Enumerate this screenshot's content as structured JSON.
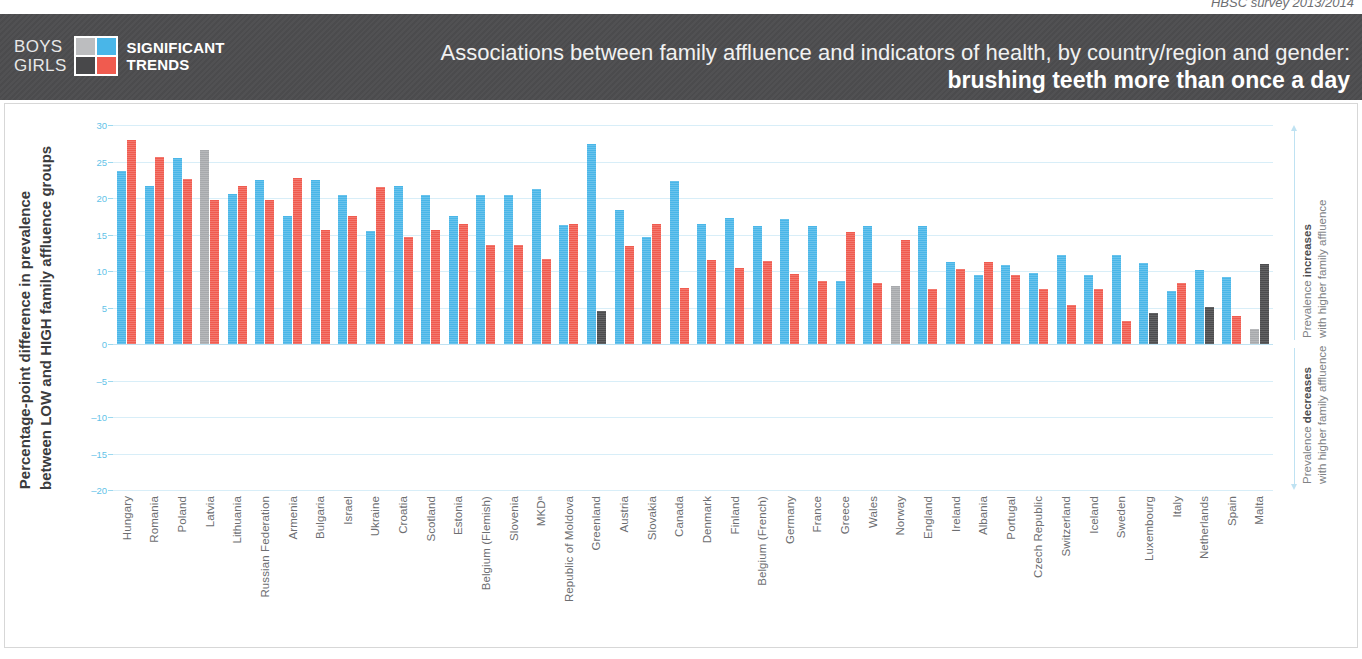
{
  "survey_note": "HBSC survey 2013/2014",
  "legend": {
    "boys_label": "BOYS",
    "girls_label": "GIRLS",
    "significant_line1": "SIGNIFICANT",
    "significant_line2": "TRENDS",
    "colors": {
      "boys_significant": "#49b6e8",
      "girls_significant": "#f05b4f",
      "boys_not_significant": "#a7a9ac",
      "girls_not_significant": "#4d4d4f"
    }
  },
  "header": {
    "title": "Associations between family affluence and indicators of health, by country/region and gender:",
    "subtitle": "brushing teeth more than once a day"
  },
  "axis": {
    "y_caption_line1": "Percentage-point difference in prevalence",
    "y_caption_line2": "between LOW and HIGH family affluence groups",
    "right_top_line1": "Prevalence increases",
    "right_top_bold": "increases",
    "right_top_line2": "with higher family affluence",
    "right_bottom_line1": "Prevalence decreases",
    "right_bottom_bold": "decreases",
    "right_bottom_line2": "with higher family affluence"
  },
  "chart_data": {
    "type": "bar",
    "title": "Associations between family affluence and indicators of health, by country/region and gender: brushing teeth more than once a day",
    "xlabel": "",
    "ylabel": "Percentage-point difference in prevalence between LOW and HIGH family affluence groups",
    "ylim": [
      -20,
      30
    ],
    "yticks": [
      30,
      25,
      20,
      15,
      10,
      5,
      0,
      -5,
      -10,
      -15,
      -20
    ],
    "ytick_labels": [
      "30",
      "25",
      "20",
      "15",
      "10",
      "5",
      "0",
      "–5",
      "–10",
      "–15",
      "–20"
    ],
    "grid": true,
    "legend_position": "top-left",
    "series": [
      {
        "name": "Boys",
        "key": "boys"
      },
      {
        "name": "Girls",
        "key": "girls"
      }
    ],
    "categories": [
      "Hungary",
      "Romania",
      "Poland",
      "Latvia",
      "Lithuania",
      "Russian Federation",
      "Armenia",
      "Bulgaria",
      "Israel",
      "Ukraine",
      "Croatia",
      "Scotland",
      "Estonia",
      "Belgium (Flemish)",
      "Slovenia",
      "MKDᵃ",
      "Republic of Moldova",
      "Greenland",
      "Austria",
      "Slovakia",
      "Canada",
      "Denmark",
      "Finland",
      "Belgium (French)",
      "Germany",
      "France",
      "Greece",
      "Wales",
      "Norway",
      "England",
      "Ireland",
      "Albania",
      "Portugal",
      "Czech Republic",
      "Switzerland",
      "Iceland",
      "Sweden",
      "Luxembourg",
      "Italy",
      "Netherlands",
      "Spain",
      "Malta"
    ],
    "points": [
      {
        "country": "Hungary",
        "boys": 23.7,
        "girls": 27.9,
        "boys_sig": true,
        "girls_sig": true
      },
      {
        "country": "Romania",
        "boys": 21.6,
        "girls": 25.6,
        "boys_sig": true,
        "girls_sig": true
      },
      {
        "country": "Poland",
        "boys": 25.5,
        "girls": 22.6,
        "boys_sig": true,
        "girls_sig": true
      },
      {
        "country": "Latvia",
        "boys": 26.6,
        "girls": 19.7,
        "boys_sig": false,
        "girls_sig": true
      },
      {
        "country": "Lithuania",
        "boys": 20.5,
        "girls": 21.6,
        "boys_sig": true,
        "girls_sig": true
      },
      {
        "country": "Russian Federation",
        "boys": 22.5,
        "girls": 19.7,
        "boys_sig": true,
        "girls_sig": true
      },
      {
        "country": "Armenia",
        "boys": 17.6,
        "girls": 22.7,
        "boys_sig": true,
        "girls_sig": true
      },
      {
        "country": "Bulgaria",
        "boys": 22.5,
        "girls": 15.6,
        "boys_sig": true,
        "girls_sig": true
      },
      {
        "country": "Israel",
        "boys": 20.4,
        "girls": 17.5,
        "boys_sig": true,
        "girls_sig": true
      },
      {
        "country": "Ukraine",
        "boys": 15.5,
        "girls": 21.5,
        "boys_sig": true,
        "girls_sig": true
      },
      {
        "country": "Croatia",
        "boys": 21.6,
        "girls": 14.7,
        "boys_sig": true,
        "girls_sig": true
      },
      {
        "country": "Scotland",
        "boys": 20.4,
        "girls": 15.6,
        "boys_sig": true,
        "girls_sig": true
      },
      {
        "country": "Estonia",
        "boys": 17.5,
        "girls": 16.5,
        "boys_sig": true,
        "girls_sig": true
      },
      {
        "country": "Belgium (Flemish)",
        "boys": 20.4,
        "girls": 13.6,
        "boys_sig": true,
        "girls_sig": true
      },
      {
        "country": "Slovenia",
        "boys": 20.4,
        "girls": 13.6,
        "boys_sig": true,
        "girls_sig": true
      },
      {
        "country": "MKDᵃ",
        "boys": 21.3,
        "girls": 11.6,
        "boys_sig": true,
        "girls_sig": true
      },
      {
        "country": "Republic of Moldova",
        "boys": 16.3,
        "girls": 16.4,
        "boys_sig": true,
        "girls_sig": true
      },
      {
        "country": "Greenland",
        "boys": 27.4,
        "girls": 4.5,
        "boys_sig": true,
        "girls_sig": false
      },
      {
        "country": "Austria",
        "boys": 18.4,
        "girls": 13.4,
        "boys_sig": true,
        "girls_sig": true
      },
      {
        "country": "Slovakia",
        "boys": 14.6,
        "girls": 16.4,
        "boys_sig": true,
        "girls_sig": true
      },
      {
        "country": "Canada",
        "boys": 22.3,
        "girls": 7.7,
        "boys_sig": true,
        "girls_sig": true
      },
      {
        "country": "Denmark",
        "boys": 16.4,
        "girls": 11.5,
        "boys_sig": true,
        "girls_sig": true
      },
      {
        "country": "Finland",
        "boys": 17.2,
        "girls": 10.4,
        "boys_sig": true,
        "girls_sig": true
      },
      {
        "country": "Belgium (French)",
        "boys": 16.2,
        "girls": 11.4,
        "boys_sig": true,
        "girls_sig": true
      },
      {
        "country": "Germany",
        "boys": 17.1,
        "girls": 9.6,
        "boys_sig": true,
        "girls_sig": true
      },
      {
        "country": "France",
        "boys": 16.2,
        "girls": 8.6,
        "boys_sig": true,
        "girls_sig": true
      },
      {
        "country": "Greece",
        "boys": 8.6,
        "girls": 15.3,
        "boys_sig": true,
        "girls_sig": true
      },
      {
        "country": "Wales",
        "boys": 16.1,
        "girls": 8.3,
        "boys_sig": true,
        "girls_sig": true
      },
      {
        "country": "Norway",
        "boys": 8.0,
        "girls": 14.3,
        "boys_sig": false,
        "girls_sig": true
      },
      {
        "country": "England",
        "boys": 16.2,
        "girls": 7.6,
        "boys_sig": true,
        "girls_sig": true
      },
      {
        "country": "Ireland",
        "boys": 11.2,
        "girls": 10.3,
        "boys_sig": true,
        "girls_sig": true
      },
      {
        "country": "Albania",
        "boys": 9.4,
        "girls": 11.2,
        "boys_sig": true,
        "girls_sig": true
      },
      {
        "country": "Portugal",
        "boys": 10.8,
        "girls": 9.4,
        "boys_sig": true,
        "girls_sig": true
      },
      {
        "country": "Czech Republic",
        "boys": 9.7,
        "girls": 7.5,
        "boys_sig": true,
        "girls_sig": true
      },
      {
        "country": "Switzerland",
        "boys": 12.2,
        "girls": 5.3,
        "boys_sig": true,
        "girls_sig": true
      },
      {
        "country": "Iceland",
        "boys": 9.4,
        "girls": 7.5,
        "boys_sig": true,
        "girls_sig": true
      },
      {
        "country": "Sweden",
        "boys": 12.2,
        "girls": 3.1,
        "boys_sig": true,
        "girls_sig": true
      },
      {
        "country": "Luxembourg",
        "boys": 11.1,
        "girls": 4.3,
        "boys_sig": true,
        "girls_sig": false
      },
      {
        "country": "Italy",
        "boys": 7.3,
        "girls": 8.3,
        "boys_sig": true,
        "girls_sig": true
      },
      {
        "country": "Netherlands",
        "boys": 10.2,
        "girls": 5.1,
        "boys_sig": true,
        "girls_sig": false
      },
      {
        "country": "Spain",
        "boys": 9.2,
        "girls": 3.9,
        "boys_sig": true,
        "girls_sig": true
      },
      {
        "country": "Malta",
        "boys": 2.0,
        "girls": 11.0,
        "boys_sig": false,
        "girls_sig": false
      }
    ]
  }
}
